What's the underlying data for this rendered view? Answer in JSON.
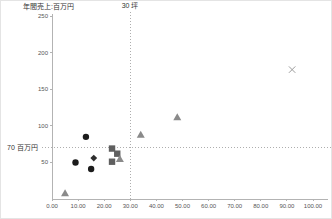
{
  "labels": {
    "y_axis_title": "年間売上:百万円",
    "vline_label": "30 坪",
    "hline_label": "70 百万円"
  },
  "chart_data": {
    "type": "scatter",
    "title": "",
    "xlabel": "",
    "ylabel": "年間売上:百万円",
    "xlim": [
      0,
      105
    ],
    "ylim": [
      0,
      255
    ],
    "grid": false,
    "legend": "none",
    "x_tick_values": [
      0,
      10,
      20,
      30,
      40,
      50,
      60,
      70,
      80,
      90,
      100
    ],
    "x_tick_labels": [
      "0.00",
      "10.00",
      "20.00",
      "30.00",
      "40.00",
      "50.00",
      "60.00",
      "70.00",
      "80.00",
      "90.00",
      "100.00"
    ],
    "y_tick_values": [
      50,
      100,
      150,
      200,
      250
    ],
    "y_tick_labels": [
      "50",
      "100",
      "150",
      "200",
      "250"
    ],
    "reference_lines": [
      {
        "axis": "x",
        "value": 30,
        "label": "30 坪",
        "style": "dotted"
      },
      {
        "axis": "y",
        "value": 70,
        "label": "70 百万円",
        "style": "dotted"
      }
    ],
    "series": [
      {
        "name": "black-circles",
        "marker": "circle",
        "color": "#1c1c1c",
        "points": [
          [
            13,
            85
          ],
          [
            9,
            50
          ],
          [
            15,
            41
          ]
        ]
      },
      {
        "name": "black-diamond",
        "marker": "diamond",
        "color": "#2e2e2e",
        "points": [
          [
            16,
            56
          ]
        ]
      },
      {
        "name": "gray-squares",
        "marker": "square",
        "color": "#5f5f5f",
        "points": [
          [
            23,
            69
          ],
          [
            25,
            62
          ],
          [
            23,
            51
          ]
        ]
      },
      {
        "name": "gray-triangles",
        "marker": "triangle",
        "color": "#8a8a8a",
        "points": [
          [
            5,
            8
          ],
          [
            26,
            55
          ],
          [
            34,
            88
          ],
          [
            48,
            112
          ]
        ]
      },
      {
        "name": "gray-cross",
        "marker": "x",
        "color": "#9c9c9c",
        "points": [
          [
            92,
            177
          ]
        ]
      }
    ]
  }
}
